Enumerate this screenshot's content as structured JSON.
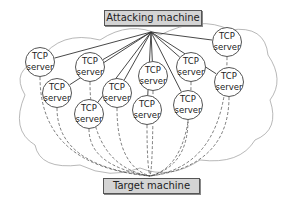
{
  "diagram": {
    "attacker": {
      "label": "Attacking machine"
    },
    "target": {
      "label": "Target machine"
    },
    "servers": [
      {
        "line1": "TCP",
        "line2": "server",
        "x": 40,
        "y": 62
      },
      {
        "line1": "TCP",
        "line2": "server",
        "x": 90,
        "y": 67
      },
      {
        "line1": "TCP",
        "line2": "server",
        "x": 57,
        "y": 93
      },
      {
        "line1": "TCP",
        "line2": "server",
        "x": 117,
        "y": 93
      },
      {
        "line1": "TCP",
        "line2": "server",
        "x": 89,
        "y": 114
      },
      {
        "line1": "TCP",
        "line2": "server",
        "x": 153,
        "y": 76
      },
      {
        "line1": "TCP",
        "line2": "server",
        "x": 147,
        "y": 110
      },
      {
        "line1": "TCP",
        "line2": "server",
        "x": 191,
        "y": 67
      },
      {
        "line1": "TCP",
        "line2": "server",
        "x": 188,
        "y": 105
      },
      {
        "line1": "TCP",
        "line2": "server",
        "x": 227,
        "y": 42
      },
      {
        "line1": "TCP",
        "line2": "server",
        "x": 229,
        "y": 82
      }
    ]
  }
}
